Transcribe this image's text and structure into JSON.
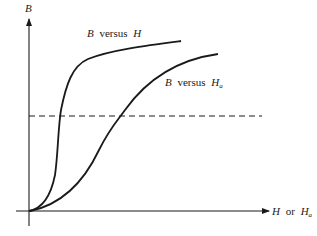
{
  "figure": {
    "type": "schematic-curves",
    "y_axis_label": "B",
    "x_axis_label": {
      "main": "H",
      "connector": "or",
      "alt_main": "H",
      "alt_subscript": "a"
    },
    "curves": [
      {
        "id": "b-versus-h",
        "label": {
          "var": "B",
          "word": "versus",
          "of": "H",
          "subscript": ""
        },
        "description": "steep initial rise, sharp knee, then saturating slowly"
      },
      {
        "id": "b-versus-ha",
        "label": {
          "var": "B",
          "word": "versus",
          "of": "H",
          "subscript": "a"
        },
        "description": "gradual S-shaped rise, saturating at larger applied field"
      }
    ],
    "reference_line": {
      "style": "dashed",
      "orientation": "horizontal"
    },
    "colors": {
      "ink": "#1a1a1a",
      "background": "#ffffff"
    }
  }
}
